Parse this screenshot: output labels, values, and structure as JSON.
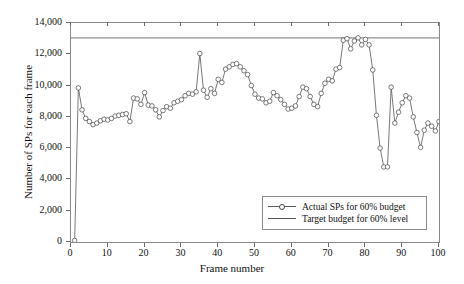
{
  "chart_data": {
    "type": "line",
    "title": "",
    "xlabel": "Frame number",
    "ylabel": "Number of SPs for each frame",
    "xlim": [
      0,
      100
    ],
    "ylim": [
      0,
      14000
    ],
    "xticks": [
      0,
      10,
      20,
      30,
      40,
      50,
      60,
      70,
      80,
      90,
      100
    ],
    "xtick_labels": [
      "0",
      "10",
      "20",
      "30",
      "40",
      "50",
      "60",
      "70",
      "80",
      "90",
      "100"
    ],
    "yticks": [
      0,
      2000,
      4000,
      6000,
      8000,
      10000,
      12000,
      14000
    ],
    "ytick_labels": [
      "0",
      "2,000",
      "4,000",
      "6,000",
      "8,000",
      "10,000",
      "12,000",
      "14,000"
    ],
    "grid": false,
    "legend_position": "lower right",
    "series": [
      {
        "name": "Actual SPs for 60% budget",
        "marker": "circle",
        "color": "#555555",
        "x": [
          1,
          2,
          3,
          4,
          5,
          6,
          7,
          8,
          9,
          10,
          11,
          12,
          13,
          14,
          15,
          16,
          17,
          18,
          19,
          20,
          21,
          22,
          23,
          24,
          25,
          26,
          27,
          28,
          29,
          30,
          31,
          32,
          33,
          34,
          35,
          36,
          37,
          38,
          39,
          40,
          41,
          42,
          43,
          44,
          45,
          46,
          47,
          48,
          49,
          50,
          51,
          52,
          53,
          54,
          55,
          56,
          57,
          58,
          59,
          60,
          61,
          62,
          63,
          64,
          65,
          66,
          67,
          68,
          69,
          70,
          71,
          72,
          73,
          74,
          75,
          76,
          77,
          78,
          79,
          80,
          81,
          82,
          83,
          84,
          85,
          86,
          87,
          88,
          89,
          90,
          91,
          92,
          93,
          94,
          95,
          96,
          97,
          98,
          99,
          100
        ],
        "y": [
          100,
          9850,
          8450,
          7900,
          7700,
          7500,
          7600,
          7750,
          7850,
          7800,
          7900,
          8050,
          8100,
          8150,
          8200,
          7700,
          9200,
          9150,
          8800,
          9550,
          8750,
          8700,
          8450,
          8000,
          8400,
          8650,
          8550,
          8900,
          9000,
          9100,
          9350,
          9500,
          9450,
          9600,
          12050,
          9700,
          9250,
          9800,
          9500,
          10400,
          10200,
          11050,
          11200,
          11350,
          11400,
          11200,
          10950,
          10700,
          10000,
          9450,
          9200,
          9150,
          8900,
          9000,
          9550,
          9350,
          9100,
          8800,
          8500,
          8550,
          8700,
          9300,
          9900,
          9800,
          9300,
          8800,
          8650,
          9500,
          10150,
          10400,
          10300,
          11050,
          11150,
          12900,
          13000,
          12350,
          12850,
          13050,
          12600,
          12950,
          12600,
          11000,
          8100,
          6000,
          4800,
          4800,
          9900,
          7600,
          8300,
          8900,
          9350,
          9200,
          8000,
          7000,
          6050,
          7150,
          7600,
          7400,
          7100,
          7700
        ]
      },
      {
        "name": "Target budget for 60% level",
        "marker": "none",
        "color": "#909090",
        "constant_value": 13050
      }
    ]
  },
  "legend": {
    "items": [
      {
        "label": "Actual SPs for 60% budget"
      },
      {
        "label": "Target budget for 60% level"
      }
    ]
  }
}
